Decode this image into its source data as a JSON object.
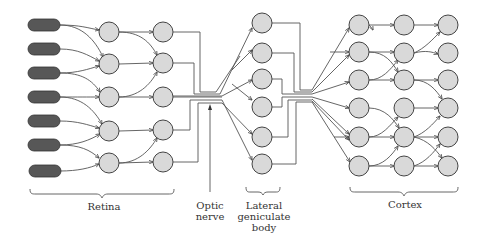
{
  "diagram": {
    "labels": {
      "retina": "Retina",
      "optic_nerve_line1": "Optic",
      "optic_nerve_line2": "nerve",
      "lgn_line1": "Lateral",
      "lgn_line2": "geniculate",
      "lgn_line3": "body",
      "cortex": "Cortex"
    },
    "colors": {
      "receptor": "#575757",
      "neuron": "#d9d9d9",
      "line": "#555555"
    },
    "stages": [
      {
        "name": "Photoreceptors",
        "count": 7
      },
      {
        "name": "Retina layer 1",
        "count": 5
      },
      {
        "name": "Retina layer 2",
        "count": 5
      },
      {
        "name": "Lateral geniculate body",
        "count": 6
      },
      {
        "name": "Cortex layer 1",
        "count": 6
      },
      {
        "name": "Cortex layer 2",
        "count": 6
      },
      {
        "name": "Cortex layer 3",
        "count": 6
      }
    ]
  }
}
